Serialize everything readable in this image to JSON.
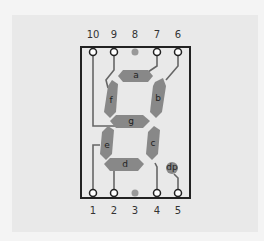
{
  "diagram": {
    "title": "",
    "colors": {
      "background": "#f4f4f4",
      "panel": "#e9e9e9",
      "outline": "#222222",
      "segment": "#888888",
      "trace": "#666666",
      "unused_pin": "#999999"
    },
    "top_pins": [
      {
        "label": "10"
      },
      {
        "label": "9"
      },
      {
        "label": "8"
      },
      {
        "label": "7"
      },
      {
        "label": "6"
      }
    ],
    "bottom_pins": [
      {
        "label": "1"
      },
      {
        "label": "2"
      },
      {
        "label": "3"
      },
      {
        "label": "4"
      },
      {
        "label": "5"
      }
    ],
    "segments": [
      {
        "id": "a",
        "label": "a"
      },
      {
        "id": "b",
        "label": "b"
      },
      {
        "id": "c",
        "label": "c"
      },
      {
        "id": "d",
        "label": "d"
      },
      {
        "id": "e",
        "label": "e"
      },
      {
        "id": "f",
        "label": "f"
      },
      {
        "id": "g",
        "label": "g"
      },
      {
        "id": "dp",
        "label": "dp"
      }
    ]
  }
}
